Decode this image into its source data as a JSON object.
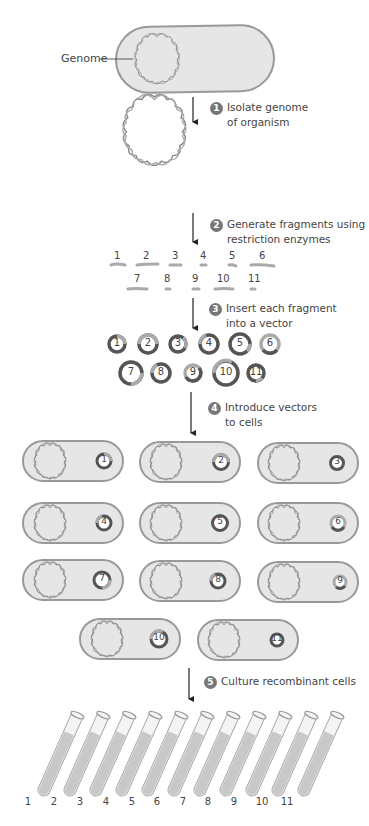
{
  "labels": {
    "genome": "Genome"
  },
  "steps": [
    {
      "num": "1",
      "line1": "Isolate genome",
      "line2": "of organism"
    },
    {
      "num": "2",
      "line1": "Generate fragments using",
      "line2": "restriction enzymes"
    },
    {
      "num": "3",
      "line1": "Insert each fragment",
      "line2": "into a vector"
    },
    {
      "num": "4",
      "line1": "Introduce vectors",
      "line2": "to cells"
    },
    {
      "num": "5",
      "line1": "Culture recombinant cells",
      "line2": ""
    }
  ],
  "fragments": [
    "1",
    "2",
    "3",
    "4",
    "5",
    "6",
    "7",
    "8",
    "9",
    "10",
    "11"
  ],
  "vectors": [
    "1",
    "2",
    "3",
    "4",
    "5",
    "6",
    "7",
    "8",
    "9",
    "10",
    "11"
  ],
  "cells": [
    "1",
    "2",
    "3",
    "4",
    "5",
    "6",
    "7",
    "8",
    "9",
    "10",
    "11"
  ],
  "tubes": [
    "1",
    "2",
    "3",
    "4",
    "5",
    "6",
    "7",
    "8",
    "9",
    "10",
    "11"
  ],
  "colors": {
    "cell_fill": "#e6e6e6",
    "cell_stroke": "#999999",
    "dna": "#888888",
    "vector_dark": "#555555",
    "vector_light": "#aaaaaa",
    "step_badge": "#777777",
    "tube_liquid": "#c8c8c8"
  }
}
